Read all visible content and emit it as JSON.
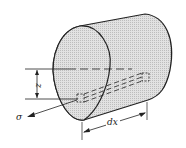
{
  "diagram": {
    "type": "beam-element-with-fiber",
    "labels": {
      "z": "z",
      "dx": "dx",
      "sigma": "σ"
    },
    "colors": {
      "stroke": "#222222",
      "fill": "#d9d9d9",
      "background": "#ffffff"
    }
  }
}
